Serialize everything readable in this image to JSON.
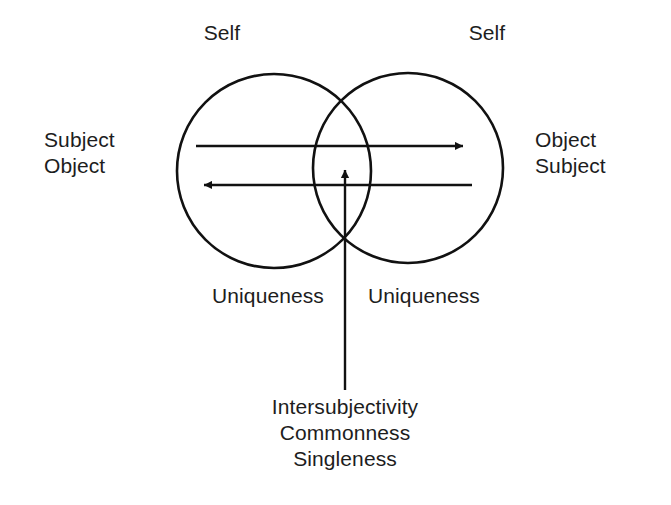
{
  "figure": {
    "background_color": "#ffffff",
    "stroke_color": "#111111",
    "text_color": "#1d1d1d"
  },
  "labels": {
    "self_left": "Self",
    "self_right": "Self",
    "left_side_line1": "Subject",
    "left_side_line2": "Object",
    "right_side_line1": "Object",
    "right_side_line2": "Subject",
    "uniqueness_left": "Uniqueness",
    "uniqueness_right": "Uniqueness",
    "bottom_line1": "Intersubjectivity",
    "bottom_line2": "Commonness",
    "bottom_line3": "Singleness"
  },
  "shapes": {
    "circle_left": {
      "cx": 274,
      "cy": 171,
      "r": 97
    },
    "circle_right": {
      "cx": 408,
      "cy": 168,
      "r": 95
    },
    "arrow_rightward": {
      "x1": 196,
      "y1": 146,
      "x2": 470,
      "y2": 146,
      "direction": "right"
    },
    "arrow_leftward": {
      "x1": 472,
      "y1": 185,
      "x2": 197,
      "y2": 185,
      "direction": "left"
    },
    "arrow_upward": {
      "x1": 345,
      "y1": 390,
      "x2": 345,
      "y2": 163,
      "direction": "up"
    }
  },
  "icons": {
    "arrow_right": "arrow-right-icon",
    "arrow_left": "arrow-left-icon",
    "arrow_up": "arrow-up-icon",
    "circle": "circle-icon"
  }
}
